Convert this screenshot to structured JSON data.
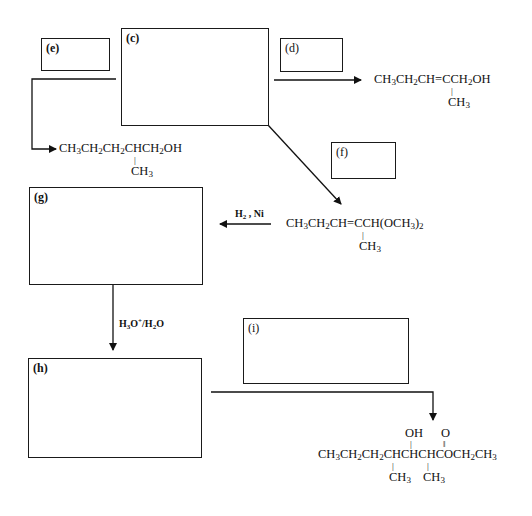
{
  "boxes": {
    "c": {
      "label": "(c)"
    },
    "d": {
      "label": "(d)"
    },
    "e": {
      "label": "(e)"
    },
    "f": {
      "label": "(f)"
    },
    "g": {
      "label": "(g)"
    },
    "h": {
      "label": "(h)"
    },
    "i": {
      "label": "(i)"
    }
  },
  "compounds": {
    "allylic_alcohol": {
      "main": [
        "CH",
        "3",
        "CH",
        "2",
        "CH=CCH",
        "2",
        "OH"
      ],
      "branch": [
        "CH",
        "3"
      ],
      "text": "CH3CH2CH=CCH2OH (2-CH3)"
    },
    "saturated_alcohol": {
      "main": [
        "CH",
        "3",
        "CH",
        "2",
        "CH",
        "2",
        "CHCH",
        "2",
        "OH"
      ],
      "branch": [
        "CH",
        "3"
      ],
      "text": "CH3CH2CH2CHCH2OH (2-CH3)"
    },
    "acetal": {
      "main": [
        "CH",
        "3",
        "CH",
        "2",
        "CH=CCH(OCH",
        "3",
        ")",
        "2"
      ],
      "branch": [
        "CH",
        "3"
      ],
      "text": "CH3CH2CH=CCH(OCH3)2 (2-CH3)"
    },
    "hydroxy_ester": {
      "main": [
        "CH",
        "3",
        "CH",
        "2",
        "CH",
        "2",
        "CHCHCHCOCH",
        "2",
        "CH",
        "3"
      ],
      "top_oh": "OH",
      "top_o": "O",
      "branch1": [
        "CH",
        "3"
      ],
      "branch2": [
        "CH",
        "3"
      ],
      "text": "CH3CH2CH2CH(CH3)CH(OH)CH(CH3)C(=O)OCH2CH3"
    }
  },
  "reagents": {
    "hydrogenation": {
      "parts": [
        "H",
        "2",
        " , Ni"
      ],
      "text": "H2 , Ni"
    },
    "hydrolysis": {
      "parts": [
        "H",
        "3",
        "O",
        "+",
        "/H",
        "2",
        "O"
      ],
      "text": "H3O+/H2O"
    }
  }
}
